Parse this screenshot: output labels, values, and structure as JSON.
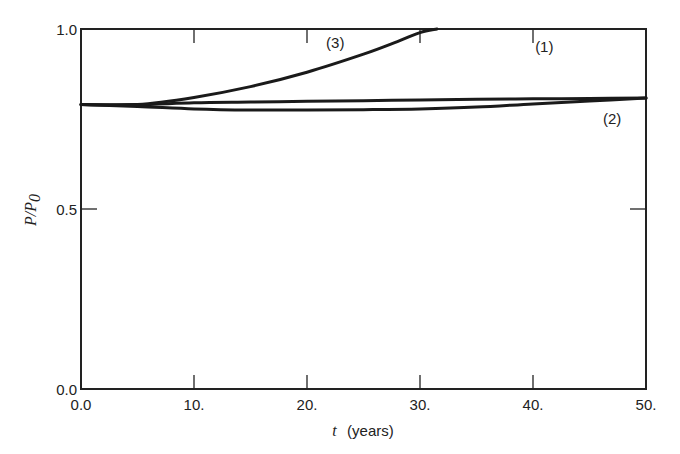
{
  "chart_data": {
    "type": "line",
    "title": "",
    "xlabel": "t (years)",
    "xlabel_var": "t",
    "xlabel_unit": "(years)",
    "ylabel": "P/P0",
    "ylabel_main": "P/P",
    "ylabel_sub": "0",
    "xlim": [
      0,
      50
    ],
    "ylim": [
      0,
      1.0
    ],
    "grid": false,
    "legend": "inline curve labels",
    "x_ticks": [
      0,
      10,
      20,
      30,
      40,
      50
    ],
    "x_tick_labels": [
      "0.0",
      "10.",
      "20.",
      "30.",
      "40.",
      "50."
    ],
    "y_ticks": [
      0.0,
      0.5,
      1.0
    ],
    "y_tick_labels": [
      "0.0",
      "0.5",
      "1.0"
    ],
    "series": [
      {
        "name": "(1)",
        "x": [
          0,
          5,
          10,
          15,
          20,
          25,
          30,
          35,
          40,
          45,
          50
        ],
        "values": [
          0.79,
          0.79,
          0.795,
          0.797,
          0.799,
          0.801,
          0.803,
          0.805,
          0.806,
          0.807,
          0.808
        ]
      },
      {
        "name": "(2)",
        "x": [
          0,
          5,
          10,
          15,
          20,
          25,
          30,
          35,
          40,
          45,
          50
        ],
        "values": [
          0.79,
          0.785,
          0.778,
          0.775,
          0.775,
          0.776,
          0.778,
          0.783,
          0.792,
          0.8,
          0.808
        ]
      },
      {
        "name": "(3)",
        "x": [
          0,
          5,
          10,
          15,
          20,
          25,
          28,
          30,
          31.5
        ],
        "values": [
          0.79,
          0.79,
          0.81,
          0.84,
          0.88,
          0.93,
          0.965,
          0.99,
          1.0
        ]
      }
    ],
    "annotations": [
      {
        "text": "(1)",
        "x": 41,
        "y": 0.95
      },
      {
        "text": "(2)",
        "x": 47,
        "y": 0.75
      },
      {
        "text": "(3)",
        "x": 22.5,
        "y": 0.96
      }
    ]
  }
}
